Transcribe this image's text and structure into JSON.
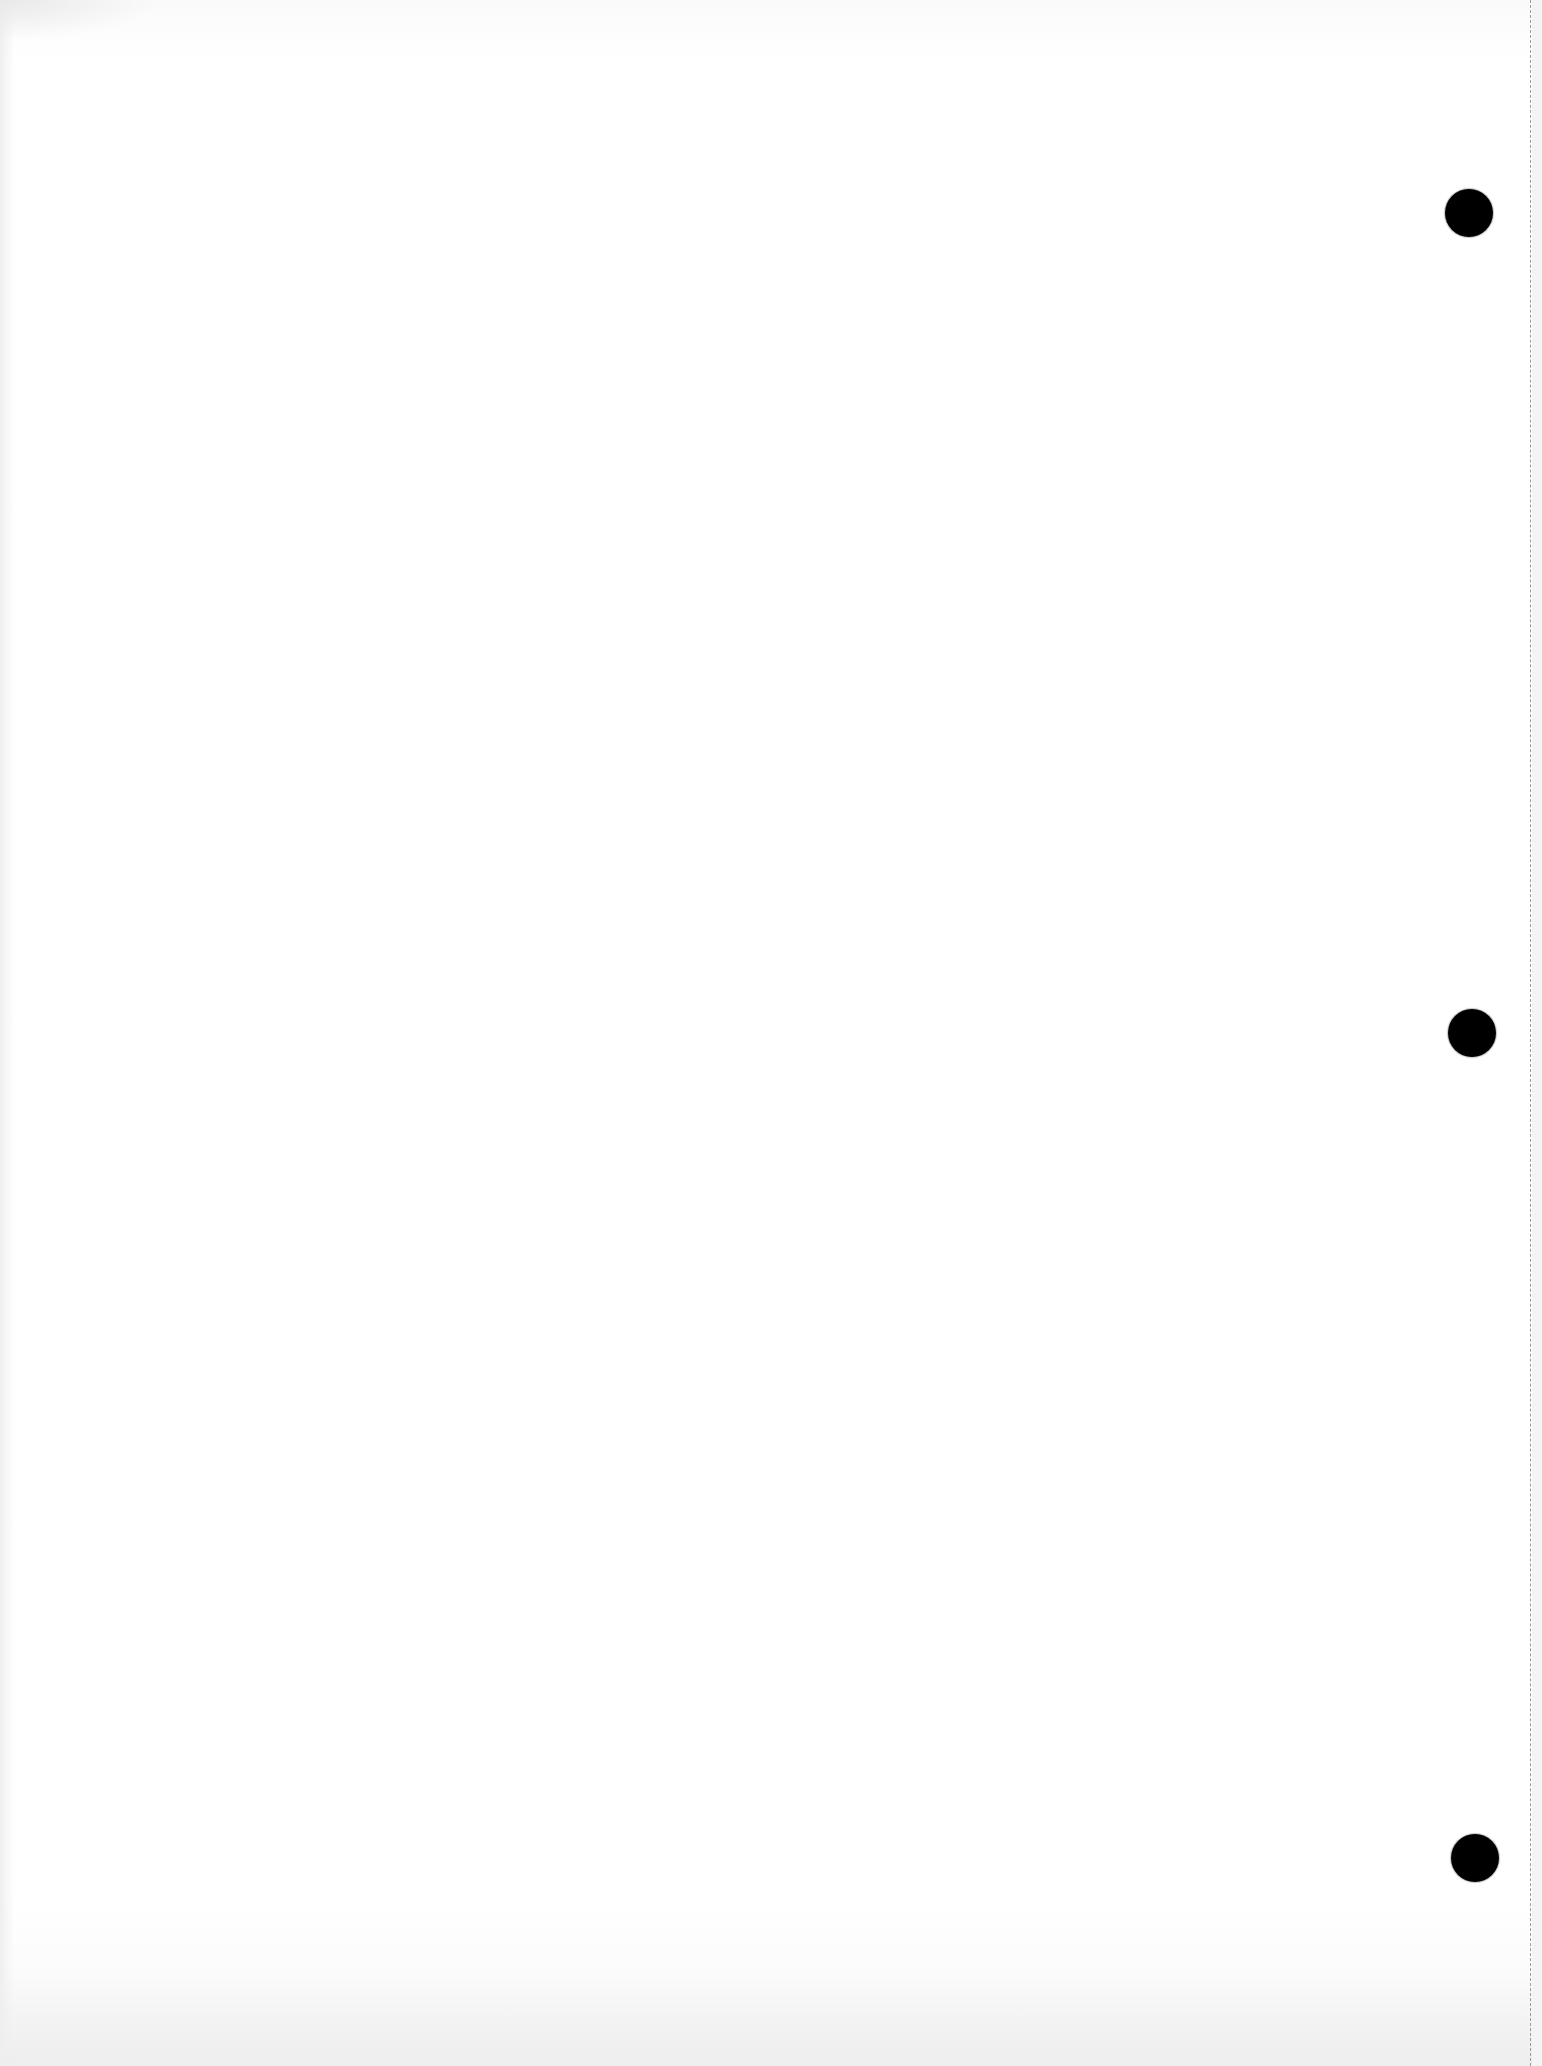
{
  "page": {
    "type": "blank hole-punched loose-leaf sheet",
    "width": 1542,
    "height": 2066,
    "background_color": "#ffffff"
  },
  "perforation": {
    "style": "dashed",
    "x": 1530,
    "color": "#9a9a9a"
  },
  "margin_strip": {
    "x": 1532,
    "color": "#f4f4f4"
  },
  "holes": [
    {
      "cx": 1469,
      "cy": 213,
      "r": 24,
      "color": "#000000"
    },
    {
      "cx": 1472,
      "cy": 1033,
      "r": 24,
      "color": "#000000"
    },
    {
      "cx": 1475,
      "cy": 1858,
      "r": 24,
      "color": "#000000"
    }
  ]
}
